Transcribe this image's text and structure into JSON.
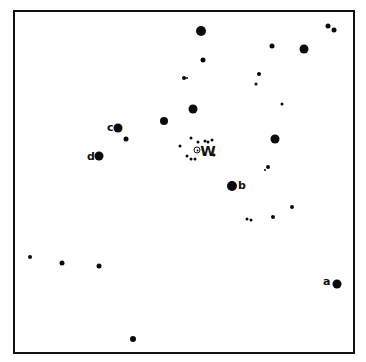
{
  "chart": {
    "title": "",
    "frame": {
      "left": 13,
      "top": 10,
      "right": 355,
      "bottom": 354
    },
    "target": {
      "name": "W",
      "x": 197,
      "y": 150,
      "label_x": 208,
      "label_y": 151
    },
    "comparison_stars": [
      {
        "label": "a",
        "x": 337,
        "y": 284,
        "size": 9,
        "label_x": 323,
        "label_y": 281
      },
      {
        "label": "b",
        "x": 232,
        "y": 186,
        "size": 10,
        "label_x": 238,
        "label_y": 185
      },
      {
        "label": "c",
        "x": 118,
        "y": 128,
        "size": 9,
        "label_x": 107,
        "label_y": 127
      },
      {
        "label": "d",
        "x": 99,
        "y": 156,
        "size": 9,
        "label_x": 87,
        "label_y": 156
      }
    ],
    "field_stars": [
      {
        "x": 201,
        "y": 31,
        "size": 10
      },
      {
        "x": 203,
        "y": 60,
        "size": 5
      },
      {
        "x": 184,
        "y": 78,
        "size": 4
      },
      {
        "x": 187,
        "y": 78,
        "size": 2
      },
      {
        "x": 272,
        "y": 46,
        "size": 5
      },
      {
        "x": 304,
        "y": 49,
        "size": 9
      },
      {
        "x": 328,
        "y": 26,
        "size": 5
      },
      {
        "x": 334,
        "y": 30,
        "size": 5
      },
      {
        "x": 259,
        "y": 74,
        "size": 4
      },
      {
        "x": 256,
        "y": 84,
        "size": 3
      },
      {
        "x": 282,
        "y": 104,
        "size": 3
      },
      {
        "x": 193,
        "y": 109,
        "size": 9
      },
      {
        "x": 164,
        "y": 121,
        "size": 8
      },
      {
        "x": 126,
        "y": 139,
        "size": 5
      },
      {
        "x": 180,
        "y": 146,
        "size": 3
      },
      {
        "x": 275,
        "y": 139,
        "size": 9
      },
      {
        "x": 268,
        "y": 167,
        "size": 4
      },
      {
        "x": 265,
        "y": 170,
        "size": 2
      },
      {
        "x": 191,
        "y": 138,
        "size": 3
      },
      {
        "x": 198,
        "y": 142,
        "size": 3
      },
      {
        "x": 205,
        "y": 141,
        "size": 3
      },
      {
        "x": 208,
        "y": 142,
        "size": 3
      },
      {
        "x": 212,
        "y": 140,
        "size": 3
      },
      {
        "x": 187,
        "y": 156,
        "size": 3
      },
      {
        "x": 191,
        "y": 159,
        "size": 3
      },
      {
        "x": 195,
        "y": 159,
        "size": 3
      },
      {
        "x": 214,
        "y": 155,
        "size": 3
      },
      {
        "x": 247,
        "y": 219,
        "size": 3
      },
      {
        "x": 251,
        "y": 220,
        "size": 3
      },
      {
        "x": 273,
        "y": 217,
        "size": 4
      },
      {
        "x": 292,
        "y": 207,
        "size": 4
      },
      {
        "x": 30,
        "y": 257,
        "size": 4
      },
      {
        "x": 62,
        "y": 263,
        "size": 5
      },
      {
        "x": 99,
        "y": 266,
        "size": 5
      },
      {
        "x": 133,
        "y": 339,
        "size": 6
      }
    ],
    "colors": {
      "ink": "#0a0a0a",
      "background": "#ffffff"
    }
  }
}
